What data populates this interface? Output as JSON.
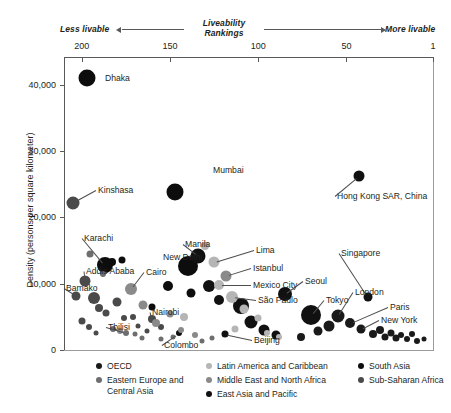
{
  "header": {
    "left_label": "Less livable",
    "right_label": "More livable",
    "title": "Liveability\nRankings",
    "title_line1": "Liveability",
    "title_line2": "Rankings"
  },
  "chart_data": {
    "type": "scatter",
    "title": "Liveability Rankings",
    "xlabel": "Liveability Rankings",
    "ylabel": "Density (persons per square kilometer)",
    "xlim": [
      210,
      1
    ],
    "ylim": [
      0,
      44000
    ],
    "x_reversed": true,
    "grid": false,
    "legend_position": "bottom",
    "xticks": [
      200,
      150,
      100,
      50,
      1
    ],
    "xticklabels": [
      "200",
      "150",
      "100",
      "50",
      "1"
    ],
    "yticks": [
      0,
      10000,
      20000,
      30000,
      40000
    ],
    "yticklabels": [
      "0",
      "10,000",
      "20,000",
      "30,000",
      "40,000"
    ],
    "legend": [
      {
        "name": "OECD",
        "color": "#1a1a1a"
      },
      {
        "name": "Eastern Europe and Central Asia",
        "color": "#6e6e6e"
      },
      {
        "name": "Latin America and Caribbean",
        "color": "#b5b5b5"
      },
      {
        "name": "Middle East and North Africa",
        "color": "#8a8a8a"
      },
      {
        "name": "East Asia and Pacific",
        "color": "#111111"
      },
      {
        "name": "South Asia",
        "color": "#0d0d0d"
      },
      {
        "name": "Sub-Saharan Africa",
        "color": "#4a4a4a"
      }
    ],
    "annotations": [
      {
        "city": "Dhaka",
        "rank": 197,
        "density": 41000
      },
      {
        "city": "Mumbai",
        "rank": 147,
        "density": 23800
      },
      {
        "city": "Kinshasa",
        "rank": 205,
        "density": 22200
      },
      {
        "city": "Hong Kong SAR, China",
        "rank": 43,
        "density": 26200
      },
      {
        "city": "Karachi",
        "rank": 187,
        "density": 12800
      },
      {
        "city": "Addis Ababa",
        "rank": 198,
        "density": 10400
      },
      {
        "city": "Bamako",
        "rank": 203,
        "density": 8200
      },
      {
        "city": "Cairo",
        "rank": 172,
        "density": 9200
      },
      {
        "city": "New Delhi",
        "rank": 140,
        "density": 12600
      },
      {
        "city": "Manila",
        "rank": 134,
        "density": 14200
      },
      {
        "city": "Nairobi",
        "rank": 160,
        "density": 4600
      },
      {
        "city": "Tbilisi",
        "rank": 175,
        "density": 2600
      },
      {
        "city": "Colombo",
        "rank": 145,
        "density": 2500
      },
      {
        "city": "Lima",
        "rank": 125,
        "density": 13200
      },
      {
        "city": "Istanbul",
        "rank": 118,
        "density": 11200
      },
      {
        "city": "Mexico City",
        "rank": 122,
        "density": 9800
      },
      {
        "city": "São Paulo",
        "rank": 115,
        "density": 8000
      },
      {
        "city": "Beijing",
        "rank": 119,
        "density": 2400
      },
      {
        "city": "Seoul",
        "rank": 85,
        "density": 8400
      },
      {
        "city": "Singapore",
        "rank": 38,
        "density": 8000
      },
      {
        "city": "Tokyo",
        "rank": 70,
        "density": 5200
      },
      {
        "city": "London",
        "rank": 55,
        "density": 5100
      },
      {
        "city": "Paris",
        "rank": 48,
        "density": 4000
      },
      {
        "city": "New York",
        "rank": 42,
        "density": 3100
      }
    ],
    "series": [
      {
        "name": "South Asia",
        "color": "#0d0d0d",
        "points": [
          {
            "rank": 197,
            "density": 41000,
            "size": 17,
            "city": "Dhaka"
          },
          {
            "rank": 147,
            "density": 23800,
            "size": 17,
            "city": "Mumbai"
          },
          {
            "rank": 187,
            "density": 12800,
            "size": 16,
            "city": "Karachi"
          },
          {
            "rank": 140,
            "density": 12600,
            "size": 20,
            "city": "New Delhi"
          },
          {
            "rank": 183,
            "density": 13200,
            "size": 8
          },
          {
            "rank": 177,
            "density": 13600,
            "size": 7
          },
          {
            "rank": 145,
            "density": 2500,
            "size": 6,
            "city": "Colombo"
          },
          {
            "rank": 151,
            "density": 9600,
            "size": 10
          },
          {
            "rank": 160,
            "density": 6500,
            "size": 7
          },
          {
            "rank": 138,
            "density": 8600,
            "size": 9
          }
        ]
      },
      {
        "name": "Sub-Saharan Africa",
        "color": "#4a4a4a",
        "points": [
          {
            "rank": 205,
            "density": 22200,
            "size": 13,
            "city": "Kinshasa"
          },
          {
            "rank": 198,
            "density": 10400,
            "size": 11,
            "city": "Addis Ababa"
          },
          {
            "rank": 203,
            "density": 8200,
            "size": 9,
            "city": "Bamako"
          },
          {
            "rank": 160,
            "density": 4600,
            "size": 8,
            "city": "Nairobi"
          },
          {
            "rank": 193,
            "density": 7800,
            "size": 12
          },
          {
            "rank": 190,
            "density": 6400,
            "size": 8
          },
          {
            "rank": 186,
            "density": 5600,
            "size": 7
          },
          {
            "rank": 200,
            "density": 4400,
            "size": 7
          },
          {
            "rank": 196,
            "density": 3400,
            "size": 6
          },
          {
            "rank": 180,
            "density": 7200,
            "size": 9
          },
          {
            "rank": 171,
            "density": 5000,
            "size": 6
          },
          {
            "rank": 168,
            "density": 3600,
            "size": 5
          },
          {
            "rank": 176,
            "density": 4800,
            "size": 6
          },
          {
            "rank": 192,
            "density": 2600,
            "size": 5
          },
          {
            "rank": 163,
            "density": 2800,
            "size": 5
          },
          {
            "rank": 155,
            "density": 3400,
            "size": 6
          }
        ]
      },
      {
        "name": "East Asia and Pacific",
        "color": "#111111",
        "points": [
          {
            "rank": 43,
            "density": 26200,
            "size": 11,
            "city": "Hong Kong SAR, China"
          },
          {
            "rank": 134,
            "density": 14200,
            "size": 15,
            "city": "Manila"
          },
          {
            "rank": 85,
            "density": 8400,
            "size": 14,
            "city": "Seoul"
          },
          {
            "rank": 38,
            "density": 8000,
            "size": 9,
            "city": "Singapore"
          },
          {
            "rank": 70,
            "density": 5200,
            "size": 20,
            "city": "Tokyo"
          },
          {
            "rank": 119,
            "density": 2400,
            "size": 7,
            "city": "Beijing"
          },
          {
            "rank": 110,
            "density": 6600,
            "size": 16
          },
          {
            "rank": 104,
            "density": 4200,
            "size": 13
          },
          {
            "rank": 97,
            "density": 3000,
            "size": 11
          },
          {
            "rank": 90,
            "density": 2200,
            "size": 9
          },
          {
            "rank": 128,
            "density": 9600,
            "size": 12
          },
          {
            "rank": 122,
            "density": 7600,
            "size": 10
          }
        ]
      },
      {
        "name": "OECD",
        "color": "#1a1a1a",
        "points": [
          {
            "rank": 55,
            "density": 5100,
            "size": 13,
            "city": "London"
          },
          {
            "rank": 48,
            "density": 4000,
            "size": 10,
            "city": "Paris"
          },
          {
            "rank": 42,
            "density": 3100,
            "size": 9,
            "city": "New York"
          },
          {
            "rank": 60,
            "density": 3600,
            "size": 11
          },
          {
            "rank": 35,
            "density": 2400,
            "size": 8
          },
          {
            "rank": 28,
            "density": 2000,
            "size": 7
          },
          {
            "rank": 22,
            "density": 1800,
            "size": 7
          },
          {
            "rank": 16,
            "density": 1600,
            "size": 6
          },
          {
            "rank": 10,
            "density": 1400,
            "size": 6
          },
          {
            "rank": 6,
            "density": 1600,
            "size": 5
          },
          {
            "rank": 31,
            "density": 3000,
            "size": 8
          },
          {
            "rank": 25,
            "density": 2600,
            "size": 7
          },
          {
            "rank": 19,
            "density": 2200,
            "size": 6
          },
          {
            "rank": 13,
            "density": 2400,
            "size": 6
          },
          {
            "rank": 66,
            "density": 2800,
            "size": 9
          },
          {
            "rank": 76,
            "density": 2000,
            "size": 8
          }
        ]
      },
      {
        "name": "Latin America and Caribbean",
        "color": "#b5b5b5",
        "points": [
          {
            "rank": 125,
            "density": 13200,
            "size": 11,
            "city": "Lima"
          },
          {
            "rank": 122,
            "density": 9800,
            "size": 10,
            "city": "Mexico City"
          },
          {
            "rank": 115,
            "density": 8000,
            "size": 12,
            "city": "São Paulo"
          },
          {
            "rank": 130,
            "density": 15600,
            "size": 8
          },
          {
            "rank": 108,
            "density": 6200,
            "size": 9
          },
          {
            "rank": 100,
            "density": 4800,
            "size": 7
          },
          {
            "rank": 113,
            "density": 3200,
            "size": 7
          },
          {
            "rank": 95,
            "density": 2600,
            "size": 6
          },
          {
            "rank": 142,
            "density": 5000,
            "size": 8
          },
          {
            "rank": 88,
            "density": 2000,
            "size": 6
          }
        ]
      },
      {
        "name": "Middle East and North Africa",
        "color": "#8a8a8a",
        "points": [
          {
            "rank": 172,
            "density": 9200,
            "size": 12,
            "city": "Cairo"
          },
          {
            "rank": 118,
            "density": 11200,
            "size": 11,
            "city": "Istanbul"
          },
          {
            "rank": 165,
            "density": 6800,
            "size": 9
          },
          {
            "rank": 158,
            "density": 4000,
            "size": 8
          },
          {
            "rank": 150,
            "density": 5400,
            "size": 7
          },
          {
            "rank": 144,
            "density": 3000,
            "size": 6
          },
          {
            "rank": 136,
            "density": 2200,
            "size": 6
          },
          {
            "rank": 178,
            "density": 2800,
            "size": 6
          }
        ]
      },
      {
        "name": "Eastern Europe and Central Asia",
        "color": "#6e6e6e",
        "points": [
          {
            "rank": 175,
            "density": 2600,
            "size": 6,
            "city": "Tbilisi"
          },
          {
            "rank": 195,
            "density": 14400,
            "size": 7
          },
          {
            "rank": 188,
            "density": 11400,
            "size": 6
          },
          {
            "rank": 182,
            "density": 3200,
            "size": 6
          },
          {
            "rank": 170,
            "density": 2400,
            "size": 5
          },
          {
            "rank": 166,
            "density": 1800,
            "size": 5
          },
          {
            "rank": 155,
            "density": 1600,
            "size": 5
          },
          {
            "rank": 148,
            "density": 2000,
            "size": 5
          },
          {
            "rank": 132,
            "density": 1400,
            "size": 5
          },
          {
            "rank": 126,
            "density": 1800,
            "size": 5
          }
        ]
      }
    ]
  }
}
